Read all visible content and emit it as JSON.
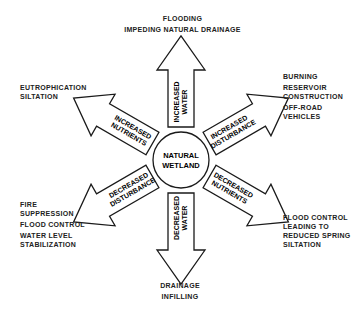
{
  "center": {
    "line1": "NATURAL",
    "line2": "WETLAND"
  },
  "arrows": [
    {
      "direction": "up",
      "line1": "INCREASED",
      "line2": "WATER"
    },
    {
      "direction": "upper-left",
      "line1": "INCREASED",
      "line2": "NUTRIENTS"
    },
    {
      "direction": "upper-right",
      "line1": "INCREASED",
      "line2": "DISTURBANCE"
    },
    {
      "direction": "lower-left",
      "line1": "DECREASED",
      "line2": "DISTURBANCE"
    },
    {
      "direction": "lower-right",
      "line1": "DECREASED",
      "line2": "NUTRIENTS"
    },
    {
      "direction": "down",
      "line1": "DECREASED",
      "line2": "WATER"
    }
  ],
  "outcomes": {
    "top": [
      "FLOODING",
      "IMPEDING NATURAL DRAINAGE"
    ],
    "upper_left": [
      "EUTROPHICATION",
      "SILTATION"
    ],
    "upper_right": [
      "BURNING",
      "RESERVOIR",
      "CONSTRUCTION",
      "OFF-ROAD",
      "VEHICLES"
    ],
    "lower_left": [
      "FIRE",
      "SUPPRESSION",
      "FLOOD CONTROL",
      "WATER LEVEL",
      "STABILIZATION"
    ],
    "lower_right": [
      "FLOOD CONTROL",
      "LEADING TO",
      "REDUCED SPRING",
      "SILTATION"
    ],
    "bottom": [
      "DRAINAGE",
      "INFILLING"
    ]
  }
}
